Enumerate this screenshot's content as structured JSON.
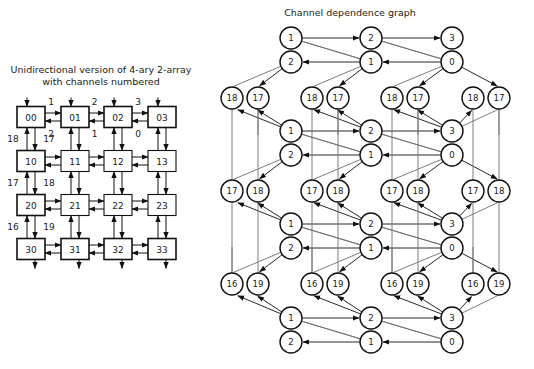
{
  "figure": {
    "left_caption_line1": "Unidirectional version of 4-ary 2-array",
    "left_caption_line2": "with channels numbered",
    "right_caption": "Channel dependence graph"
  },
  "colors": {
    "node_stroke": "#111111",
    "node_fill": "#ffffff",
    "edge": "#6f6f6f",
    "heavy_edge": "#111111",
    "text": "#1a1a1a"
  },
  "left_diagram": {
    "type": "4-ary 2-array mesh of routers",
    "node_labels": [
      [
        "00",
        "01",
        "02",
        "03"
      ],
      [
        "10",
        "11",
        "12",
        "13"
      ],
      [
        "20",
        "21",
        "22",
        "23"
      ],
      [
        "30",
        "31",
        "32",
        "33"
      ]
    ],
    "horizontal_channel_labels_top": [
      "1",
      "2",
      "3"
    ],
    "horizontal_channel_labels_bottom": [
      "2",
      "1",
      "0"
    ],
    "vertical_channel_labels": [
      {
        "left": "18",
        "right": "17"
      },
      {
        "left": "17",
        "right": "18"
      },
      {
        "left": "16",
        "right": "19"
      }
    ]
  },
  "right_diagram": {
    "type": "channel dependence graph",
    "columns": 4,
    "rows": [
      {
        "kind": "pair",
        "labels": [
          "1",
          "2",
          "3",
          "0"
        ],
        "sublabels_top": [
          "1",
          "2",
          "3"
        ],
        "sublabels_bottom": [
          "2",
          "1",
          "0"
        ]
      }
    ],
    "dependency_rows": [
      {
        "name": "row-top",
        "top": [
          "1",
          "2",
          "3"
        ],
        "bottom": [
          "2",
          "1",
          "0"
        ]
      },
      {
        "name": "row-2",
        "top": [
          "1",
          "2",
          "3"
        ],
        "bottom": [
          "2",
          "1",
          "0"
        ]
      },
      {
        "name": "row-3",
        "top": [
          "1",
          "2",
          "3"
        ],
        "bottom": [
          "2",
          "1",
          "0"
        ]
      },
      {
        "name": "row-bottom",
        "top": [
          "1",
          "2",
          "3"
        ],
        "bottom": [
          "2",
          "1",
          "0"
        ]
      }
    ],
    "channel_rows": [
      {
        "name": "channels-a",
        "pairs": [
          [
            "18",
            "17"
          ],
          [
            "18",
            "17"
          ],
          [
            "18",
            "17"
          ],
          [
            "18",
            "17"
          ]
        ]
      },
      {
        "name": "channels-b",
        "pairs": [
          [
            "17",
            "18"
          ],
          [
            "17",
            "18"
          ],
          [
            "17",
            "18"
          ],
          [
            "17",
            "18"
          ]
        ]
      },
      {
        "name": "channels-c",
        "pairs": [
          [
            "16",
            "19"
          ],
          [
            "16",
            "19"
          ],
          [
            "16",
            "19"
          ],
          [
            "16",
            "19"
          ]
        ]
      }
    ]
  }
}
